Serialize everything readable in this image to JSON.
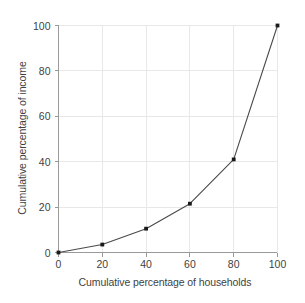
{
  "chart_data": {
    "type": "line",
    "title": "",
    "subtitle": "",
    "xlabel": "Cumulative percentage of households",
    "ylabel": "Cumulative percentage of income",
    "xlim": [
      0,
      100
    ],
    "ylim": [
      0,
      100
    ],
    "xticks": [
      0,
      20,
      40,
      60,
      80,
      100
    ],
    "yticks": [
      0,
      20,
      40,
      60,
      80,
      100
    ],
    "xtick_labels": [
      "0",
      "20",
      "40",
      "60",
      "80",
      "100"
    ],
    "ytick_labels": [
      "0",
      "20",
      "40",
      "60",
      "80",
      "100"
    ],
    "grid": true,
    "legend": "none",
    "annotations": [],
    "series": [
      {
        "name": "Lorenz curve",
        "marker": "square",
        "marker_color": "#1a1a1a",
        "line_color": "#4a4a4a",
        "x": [
          0,
          20,
          40,
          60,
          80,
          100
        ],
        "values": [
          0,
          3.5,
          10.5,
          21.5,
          41,
          100
        ],
        "points": [
          {
            "x": 0,
            "y": 0
          },
          {
            "x": 20,
            "y": 3.5
          },
          {
            "x": 40,
            "y": 10.5
          },
          {
            "x": 60,
            "y": 21.5
          },
          {
            "x": 80,
            "y": 41
          },
          {
            "x": 100,
            "y": 100
          }
        ]
      }
    ]
  },
  "style": {
    "background": "#ffffff",
    "grid_color": "#e8e8e8",
    "axis_color": "#9a9a9a",
    "text_color": "#3f3f3f",
    "line_color": "#4a4a4a",
    "marker_color": "#1a1a1a"
  }
}
